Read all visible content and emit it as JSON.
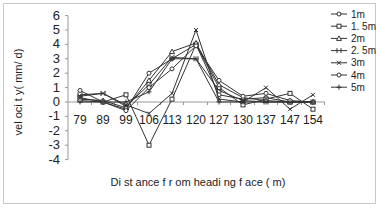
{
  "chart_data": {
    "type": "line",
    "title": "",
    "xlabel": "Di st ance f r om headi ng f ace ( m)",
    "ylabel": "vel oci t y( mm/ d)",
    "categories": [
      "79",
      "89",
      "99",
      "106",
      "113",
      "120",
      "127",
      "130",
      "137",
      "147",
      "154"
    ],
    "yticks": [
      "6",
      "5",
      "4",
      "3",
      "2",
      "1",
      "0",
      "-1",
      "-2",
      "-3",
      "-4"
    ],
    "ylim": [
      -4,
      6
    ],
    "grid": false,
    "legend_position": "right",
    "series": [
      {
        "name": "1m",
        "marker": "circle",
        "values": [
          0.8,
          0.0,
          -0.5,
          2.0,
          3.0,
          4.0,
          0.5,
          0.2,
          0.3,
          0.0,
          0.0
        ]
      },
      {
        "name": "1. 5m",
        "marker": "square",
        "values": [
          0.3,
          0.0,
          0.5,
          -3.0,
          0.2,
          4.0,
          1.0,
          -0.2,
          0.2,
          0.6,
          -0.5
        ]
      },
      {
        "name": "2m",
        "marker": "triangle",
        "values": [
          0.2,
          0.1,
          -0.4,
          1.5,
          3.5,
          4.1,
          1.2,
          0.3,
          0.1,
          0.0,
          0.0
        ]
      },
      {
        "name": "2. 5m",
        "marker": "bar",
        "values": [
          0.5,
          0.6,
          -0.3,
          1.2,
          3.1,
          3.0,
          0.8,
          0.1,
          0.0,
          0.0,
          0.0
        ]
      },
      {
        "name": "3m",
        "marker": "x",
        "values": [
          0.4,
          0.6,
          -0.2,
          -0.8,
          0.6,
          5.0,
          0.2,
          0.0,
          1.0,
          -0.5,
          0.5
        ]
      },
      {
        "name": "4m",
        "marker": "circle",
        "values": [
          0.1,
          0.0,
          -0.6,
          1.0,
          2.3,
          3.9,
          1.5,
          0.4,
          0.6,
          0.1,
          0.0
        ]
      },
      {
        "name": "5m",
        "marker": "plus",
        "values": [
          0.0,
          0.0,
          0.0,
          0.7,
          3.0,
          3.0,
          0.0,
          0.0,
          0.0,
          0.0,
          0.0
        ]
      }
    ]
  }
}
